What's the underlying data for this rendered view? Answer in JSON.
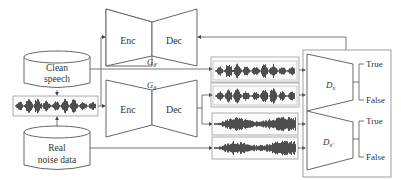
{
  "diagram": {
    "type": "SEGAN-style noise-augmented speech enhancement pipeline",
    "nodes": {
      "clean_speech": {
        "label_line1": "Clean",
        "label_line2": "speech"
      },
      "real_noise": {
        "label_line1": "Real",
        "label_line2": "noise data"
      },
      "generator_prime": {
        "enc": "Enc",
        "dec": "Dec",
        "name": "G",
        "sub": "θ'"
      },
      "generator": {
        "enc": "Enc",
        "dec": "Dec",
        "name": "G",
        "sub": "θ"
      },
      "discriminator_x": {
        "name": "D",
        "sub": "x",
        "out_true": "True",
        "out_false": "False"
      },
      "discriminator_xprime": {
        "name": "D",
        "sub": "x'",
        "out_true": "True",
        "out_false": "False"
      }
    },
    "waveforms": [
      {
        "id": "noisy-input",
        "kind": "speech+noise"
      },
      {
        "id": "enhanced-prime",
        "kind": "speech"
      },
      {
        "id": "enhanced",
        "kind": "speech"
      },
      {
        "id": "noise-1",
        "kind": "noise"
      },
      {
        "id": "noise-2",
        "kind": "noise"
      }
    ],
    "colors": {
      "line": "#555555",
      "box": "#888888",
      "wave": "#3a3a3a",
      "text": "#333333"
    }
  }
}
